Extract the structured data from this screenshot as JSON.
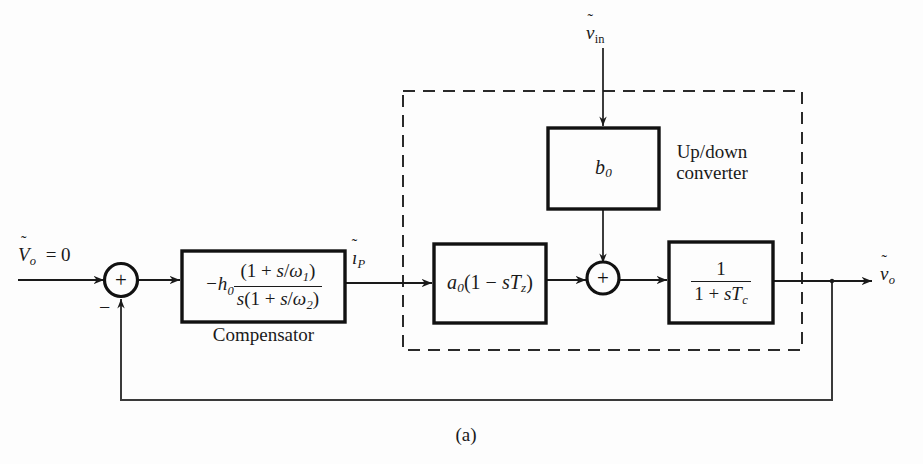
{
  "figure": {
    "caption": "(a)",
    "background_color": "#fdfdfd",
    "line_color": "#1a1a1a"
  },
  "signals": {
    "reference_input": "Ṽₒ = 0",
    "compensator_output": "ĩₚ",
    "converter_input": "ṽᵢₙ",
    "output": "ṽₒ"
  },
  "summing_junctions": [
    {
      "name": "error-summer",
      "plus_label": "+",
      "minus_label": "−",
      "inputs": [
        "reference",
        "feedback"
      ]
    },
    {
      "name": "converter-summer",
      "plus_label": "+",
      "inputs": [
        "a0-branch",
        "b0-branch"
      ]
    }
  ],
  "blocks": [
    {
      "name": "compensator",
      "caption": "Compensator",
      "gain_prefix": "−h",
      "gain_sub": "0",
      "numerator": "(1 + s/ω₁)",
      "denominator": "s(1 + s/ω₂)",
      "transfer_function": "−h₀(1 + s/ω₁) / [s(1 + s/ω₂)]"
    },
    {
      "name": "b0-gain",
      "transfer_function": "b₀",
      "symbol": "b",
      "subscript": "0"
    },
    {
      "name": "a0-zero",
      "transfer_function": "a₀(1 − sT_z)",
      "symbol": "a",
      "subscript": "0"
    },
    {
      "name": "pole",
      "numerator": "1",
      "denominator": "1 + sT_c",
      "transfer_function": "1 / (1 + sT_c)"
    }
  ],
  "groups": [
    {
      "name": "up-down-converter",
      "label": "Up/down\nconverter",
      "label_line1": "Up/down",
      "label_line2": "converter",
      "border_style": "dashed",
      "contains": [
        "b0-gain",
        "a0-zero",
        "converter-summer",
        "pole"
      ]
    }
  ],
  "feedback": {
    "description": "unity negative feedback from output to error summer",
    "sign": "−"
  }
}
